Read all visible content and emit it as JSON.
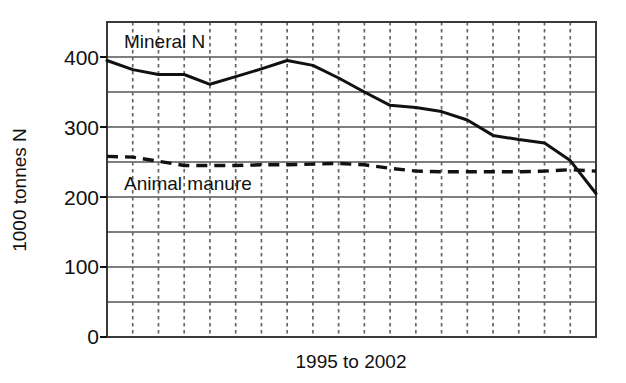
{
  "chart_data": {
    "type": "line",
    "title": "",
    "subtitle": "",
    "xlabel": "1995 to 2002",
    "ylabel": "1000 tonnes N",
    "ylim": [
      0,
      450
    ],
    "xlim": [
      0,
      19
    ],
    "y_tick_labels": [
      "0",
      "100",
      "200",
      "300",
      "400"
    ],
    "y_ticks": [
      0,
      100,
      200,
      300,
      400
    ],
    "y_minor_gridlines": [
      50,
      150,
      250,
      350
    ],
    "grid": "horizontal solid major, vertical dashed",
    "x_gridline_count": 18,
    "x_interval_count": 19,
    "legend_position": "inline-annotation",
    "x": [
      0,
      1,
      2,
      3,
      4,
      5,
      6,
      7,
      8,
      9,
      10,
      11,
      12,
      13,
      14,
      15,
      16,
      17,
      18,
      19
    ],
    "series": [
      {
        "name": "Mineral N",
        "style": "solid",
        "color": "#111111",
        "label_x": 1.0,
        "label_y": 420,
        "values": [
          395,
          383,
          375,
          375,
          368,
          360,
          372,
          382,
          395,
          390,
          375,
          360,
          345,
          330,
          327,
          322,
          310,
          288,
          280,
          272
        ]
      },
      {
        "name": "Animal manure",
        "style": "dashed",
        "color": "#111111",
        "label_x": 1.0,
        "label_y": 218,
        "values": [
          258,
          256,
          250,
          246,
          245,
          245,
          246,
          246,
          247,
          248,
          247,
          244,
          240,
          237,
          236,
          236,
          236,
          237,
          238,
          237
        ]
      }
    ],
    "series_detail": {
      "Mineral N": [
        {
          "x": 0,
          "y": 395
        },
        {
          "x": 1,
          "y": 382
        },
        {
          "x": 2,
          "y": 375
        },
        {
          "x": 3,
          "y": 375
        },
        {
          "x": 4,
          "y": 361
        },
        {
          "x": 5,
          "y": 372
        },
        {
          "x": 6,
          "y": 383
        },
        {
          "x": 7,
          "y": 395
        },
        {
          "x": 8,
          "y": 388
        },
        {
          "x": 9,
          "y": 370
        },
        {
          "x": 10,
          "y": 350
        },
        {
          "x": 11,
          "y": 331
        },
        {
          "x": 12,
          "y": 328
        },
        {
          "x": 13,
          "y": 322
        },
        {
          "x": 14,
          "y": 310
        },
        {
          "x": 15,
          "y": 288
        },
        {
          "x": 16,
          "y": 282
        },
        {
          "x": 17,
          "y": 277
        },
        {
          "x": 18,
          "y": 252
        },
        {
          "x": 19,
          "y": 205
        }
      ],
      "Animal manure": [
        {
          "x": 0,
          "y": 258
        },
        {
          "x": 1,
          "y": 257
        },
        {
          "x": 2,
          "y": 251
        },
        {
          "x": 3,
          "y": 245
        },
        {
          "x": 4,
          "y": 245
        },
        {
          "x": 5,
          "y": 245
        },
        {
          "x": 6,
          "y": 246
        },
        {
          "x": 7,
          "y": 246
        },
        {
          "x": 8,
          "y": 247
        },
        {
          "x": 9,
          "y": 248
        },
        {
          "x": 10,
          "y": 246
        },
        {
          "x": 11,
          "y": 241
        },
        {
          "x": 12,
          "y": 237
        },
        {
          "x": 13,
          "y": 236
        },
        {
          "x": 14,
          "y": 236
        },
        {
          "x": 15,
          "y": 236
        },
        {
          "x": 16,
          "y": 236
        },
        {
          "x": 17,
          "y": 237
        },
        {
          "x": 18,
          "y": 239
        },
        {
          "x": 19,
          "y": 237
        }
      ]
    }
  },
  "labels": {
    "mineral_n": "Mineral N",
    "animal_manure": "Animal manure",
    "x_axis_title": "1995 to 2002",
    "y_axis_title": "1000 tonnes N",
    "tick_0": "0",
    "tick_100": "100",
    "tick_200": "200",
    "tick_300": "300",
    "tick_400": "400"
  },
  "colors": {
    "ink": "#111111",
    "grid_major": "#555555",
    "grid_minor": "#666666",
    "background": "#ffffff"
  }
}
